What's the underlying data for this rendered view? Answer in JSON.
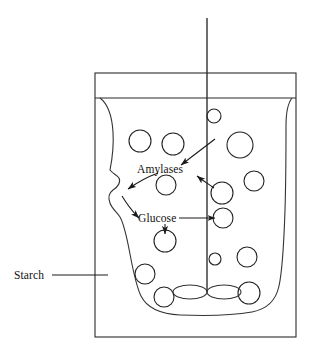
{
  "figure": {
    "kind": "science-diagram",
    "background_color": "#ffffff",
    "ink_color": "#1a1a1a"
  },
  "labels": {
    "amylases": "Amylases",
    "glucose": "Glucose",
    "starch": "Starch"
  },
  "vessel": {
    "name": "beaker",
    "outer": {
      "x": 95,
      "y": 73,
      "width": 201,
      "height": 264
    },
    "liquid_line_y": 98
  },
  "stirrer": {
    "name": "stirrer-rod",
    "x": 207,
    "top_y": 18,
    "bottom_y": 292,
    "blade_count": 2,
    "blade_rx": 17,
    "blade_ry": 7,
    "blade_y": 292
  },
  "starch_mass": {
    "name": "starch-mass",
    "description": "irregular lobed starch body filling the vessel"
  },
  "particles": [
    {
      "cx": 140,
      "cy": 141,
      "r": 11
    },
    {
      "cx": 173,
      "cy": 144,
      "r": 11
    },
    {
      "cx": 214,
      "cy": 116,
      "r": 7
    },
    {
      "cx": 240,
      "cy": 145,
      "r": 13
    },
    {
      "cx": 166,
      "cy": 185,
      "r": 10
    },
    {
      "cx": 254,
      "cy": 181,
      "r": 10
    },
    {
      "cx": 222,
      "cy": 193,
      "r": 11
    },
    {
      "cx": 223,
      "cy": 218,
      "r": 10
    },
    {
      "cx": 165,
      "cy": 241,
      "r": 11
    },
    {
      "cx": 215,
      "cy": 259,
      "r": 6
    },
    {
      "cx": 247,
      "cy": 257,
      "r": 10
    },
    {
      "cx": 145,
      "cy": 274,
      "r": 10
    },
    {
      "cx": 249,
      "cy": 293,
      "r": 11
    },
    {
      "cx": 164,
      "cy": 297,
      "r": 10
    }
  ],
  "annotations": [
    {
      "name": "amylases-inflow-arrow",
      "from": "upper-right",
      "points_to": "amylases-label",
      "style": "straight"
    },
    {
      "name": "amylases-into-starch-arrow",
      "from": "amylases-label",
      "points_to": "starch-mass",
      "style": "curved"
    },
    {
      "name": "glucose-release-arrow",
      "from": "starch-mass",
      "points_to": "glucose-label",
      "style": "curved"
    },
    {
      "name": "glucose-leader-arrow",
      "from": "glucose-label",
      "points_to": "glucose-particle",
      "style": "straight-horizontal"
    },
    {
      "name": "glucose-down-arrow",
      "from": "glucose-label",
      "points_to": "lower-particle",
      "style": "straight-vertical"
    },
    {
      "name": "particle-to-starch-arrow",
      "from": "particle",
      "points_to": "starch-mass",
      "style": "curved"
    },
    {
      "name": "starch-leader-line",
      "from": "starch-label",
      "points_to": "vessel-left-wall",
      "style": "straight-horizontal"
    }
  ]
}
